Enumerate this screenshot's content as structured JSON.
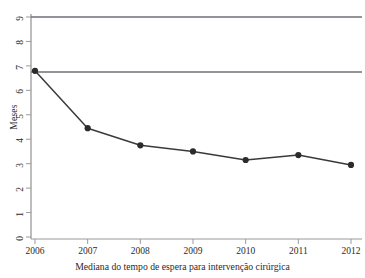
{
  "chart_data": {
    "type": "line",
    "title": "",
    "xlabel": "Mediana do tempo de espera para intervenção cirúrgica",
    "ylabel": "Meses",
    "categories": [
      "2006",
      "2007",
      "2008",
      "2009",
      "2010",
      "2011",
      "2012"
    ],
    "x": [
      2006,
      2007,
      2008,
      2009,
      2010,
      2011,
      2012
    ],
    "values": [
      6.8,
      4.45,
      3.75,
      3.5,
      3.15,
      3.35,
      2.95
    ],
    "series": [
      {
        "name": "Mediana do tempo de espera",
        "values": [
          6.8,
          4.45,
          3.75,
          3.5,
          3.15,
          3.35,
          2.95
        ]
      }
    ],
    "ylim": [
      0,
      9
    ],
    "xlim": [
      2006,
      2012
    ],
    "yticks": [
      0,
      1,
      2,
      3,
      4,
      5,
      6,
      7,
      8,
      9
    ],
    "ytick_labels": [
      "0",
      "1",
      "2",
      "3",
      "4",
      "5",
      "6",
      "7",
      "8",
      "9"
    ],
    "xtick_labels": [
      "2006",
      "2007",
      "2008",
      "2009",
      "2010",
      "2011",
      "2012"
    ],
    "grid": false,
    "legend": "none",
    "reference_lines": [
      {
        "name": "upper-reference-line",
        "value": 9.0,
        "orientation": "horizontal"
      },
      {
        "name": "baseline-reference-line",
        "value": 6.75,
        "orientation": "horizontal"
      }
    ],
    "marker": "filled-circle",
    "line_color": "#3a3a3a",
    "marker_color": "#2b2b2b",
    "reference_line_color": "#6e7078",
    "axis_color": "#9a9a9a",
    "background_color": "#ffffff"
  },
  "axes": {
    "y_title": "Meses",
    "x_title": "Mediana do tempo de espera para intervenção cirúrgica"
  },
  "top_clipped_text": ""
}
